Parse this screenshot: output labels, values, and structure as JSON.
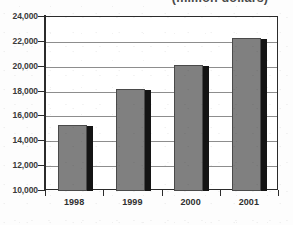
{
  "chart_data": {
    "type": "bar",
    "title": "(million dollars)",
    "subtitle": "",
    "xlabel": "",
    "ylabel": "",
    "categories": [
      "1998",
      "1999",
      "2000",
      "2001"
    ],
    "values": [
      15300,
      18200,
      20150,
      22300
    ],
    "series": [
      {
        "name": "Value",
        "values": [
          15300,
          18200,
          20150,
          22300
        ]
      }
    ],
    "ylim": [
      10000,
      24000
    ],
    "ytick_step": 2000,
    "ytick_labels": [
      "10,000",
      "12,000",
      "14,000",
      "16,000",
      "18,000",
      "20,000",
      "22,000",
      "24,000"
    ],
    "ytick_values": [
      10000,
      12000,
      14000,
      16000,
      18000,
      20000,
      22000,
      24000
    ],
    "grid": true,
    "grid_axis": "y",
    "legend": false,
    "legend_position": "none",
    "bar_fill_color": "#808080",
    "bar_edge_color": "#4a4a4a",
    "bar_shadow_color": "#141414",
    "grid_color": "#8d8d8d",
    "frame_color": "#2b2b2b",
    "background_color": "#ffffff",
    "annotations": []
  },
  "figure": {
    "title_clipped": true,
    "axis_tick_label_color": "#3a3a3a"
  }
}
